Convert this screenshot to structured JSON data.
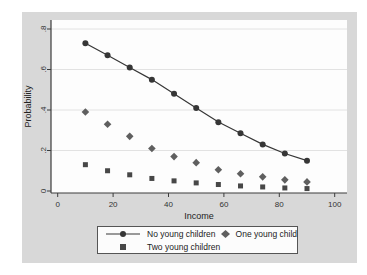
{
  "figure": {
    "background": "#d8d8d8",
    "plot_background": "#fdfdfd",
    "grid_color": "#e2e2e2",
    "axis_color": "#3c3c3c",
    "tick_text_color": "#333333"
  },
  "chart_data": {
    "type": "line",
    "title": "",
    "xlabel": "Income",
    "ylabel": "Probability",
    "xlim": [
      0,
      100
    ],
    "ylim": [
      0,
      0.8
    ],
    "grid": true,
    "legend_position": "bottom",
    "x_ticks": [
      {
        "v": 0,
        "label": "0"
      },
      {
        "v": 20,
        "label": "20"
      },
      {
        "v": 40,
        "label": "40"
      },
      {
        "v": 60,
        "label": "60"
      },
      {
        "v": 80,
        "label": "80"
      },
      {
        "v": 100,
        "label": "100"
      }
    ],
    "y_ticks": [
      {
        "v": 0,
        "label": "0"
      },
      {
        "v": 0.2,
        "label": ".2"
      },
      {
        "v": 0.4,
        "label": ".4"
      },
      {
        "v": 0.6,
        "label": ".6"
      },
      {
        "v": 0.8,
        "label": ".8"
      }
    ],
    "x": [
      10,
      18,
      26,
      34,
      42,
      50,
      58,
      66,
      74,
      82,
      90
    ],
    "series": [
      {
        "name": "No young children",
        "marker": "circle",
        "line": true,
        "color": "#363636",
        "values": [
          0.73,
          0.67,
          0.61,
          0.55,
          0.48,
          0.41,
          0.34,
          0.285,
          0.23,
          0.185,
          0.15
        ]
      },
      {
        "name": "One young child",
        "marker": "diamond",
        "line": false,
        "color": "#5f5f5f",
        "values": [
          0.39,
          0.33,
          0.27,
          0.21,
          0.17,
          0.14,
          0.105,
          0.085,
          0.07,
          0.055,
          0.045
        ]
      },
      {
        "name": "Two young children",
        "marker": "square",
        "line": false,
        "color": "#474747",
        "values": [
          0.13,
          0.1,
          0.08,
          0.062,
          0.05,
          0.04,
          0.032,
          0.025,
          0.02,
          0.015,
          0.012
        ]
      }
    ]
  }
}
